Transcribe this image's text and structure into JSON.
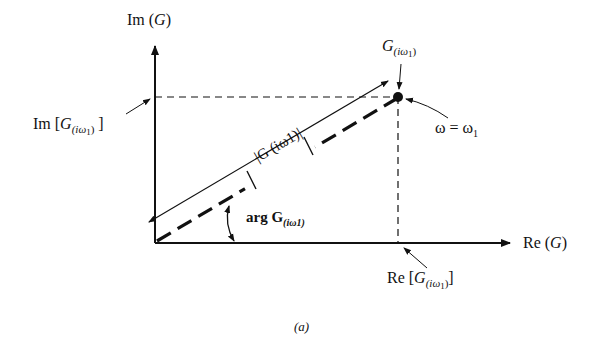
{
  "diagram": {
    "type": "complex-plane-vector",
    "labels": {
      "im_axis": {
        "prefix": "Im (",
        "var": "G",
        "suffix": ")"
      },
      "re_axis": {
        "prefix": "Re (",
        "var": "G",
        "suffix": ")"
      },
      "im_value": {
        "prefix": "Im [",
        "var": "G",
        "sub": "(iω",
        "sub_index": "1",
        "sub_close": ")",
        "suffix": " ]"
      },
      "re_value": {
        "prefix": "Re [",
        "var": "G",
        "sub": "(iω",
        "sub_index": "1",
        "sub_close": ")",
        "suffix": "]"
      },
      "point": {
        "var": "G",
        "sub": "(iω",
        "sub_index": "1",
        "sub_close": ")"
      },
      "omega": {
        "text": "ω = ω",
        "index": "1"
      },
      "magnitude": "|G (iω1)|",
      "argument": {
        "prefix": "arg ",
        "var": "G",
        "sub": "(iω1)"
      },
      "caption": "(a)"
    },
    "geometry": {
      "origin": [
        155,
        243
      ],
      "point": [
        398,
        97
      ],
      "x_axis_end": [
        510,
        243
      ],
      "y_axis_end": [
        155,
        45
      ]
    },
    "colors": {
      "ink": "#111111",
      "background": "#ffffff"
    }
  }
}
